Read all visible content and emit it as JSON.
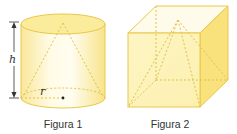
{
  "figures": [
    {
      "caption": "Figura 1",
      "shape": "cylinder-with-inscribed-cone",
      "labels": {
        "height": "h",
        "radius": "r"
      }
    },
    {
      "caption": "Figura 2",
      "shape": "cube-with-inscribed-pyramid"
    }
  ],
  "colors": {
    "fill_light": "#fdf6c8",
    "fill_mid": "#fbeb8e",
    "fill_side": "#f8e27a",
    "edge": "#e8c84a",
    "dash": "#e3c04a",
    "arrow": "#333333",
    "text": "#333333"
  }
}
